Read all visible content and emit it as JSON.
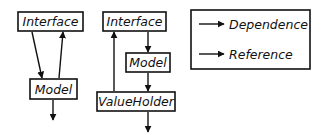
{
  "diagram": {
    "left": {
      "interface_label": "Interface",
      "model_label": "Model"
    },
    "right": {
      "interface_label": "Interface",
      "model_label": "Model",
      "valueholder_label": "ValueHolder"
    },
    "legend": {
      "items": [
        {
          "label": "Dependence",
          "icon": "arrow-right-icon"
        },
        {
          "label": "Reference",
          "icon": "arrow-right-icon"
        }
      ]
    },
    "colors": {
      "stroke": "#111111",
      "background": "#ffffff"
    }
  }
}
